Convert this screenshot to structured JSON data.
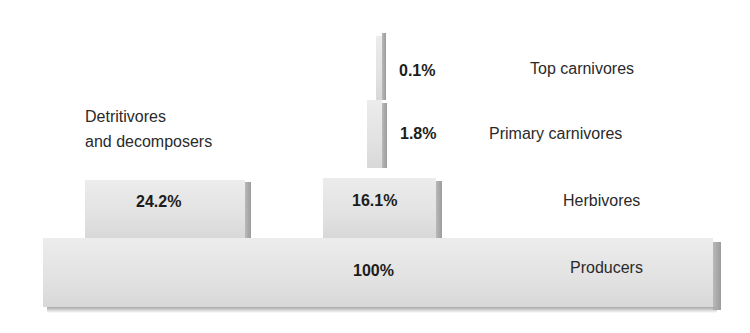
{
  "levels": [
    {
      "id": "top-carnivores",
      "name": "Top carnivores",
      "percent": "0.1%"
    },
    {
      "id": "primary-carnivores",
      "name": "Primary carnivores",
      "percent": "1.8%"
    },
    {
      "id": "herbivores",
      "name": "Herbivores",
      "percent": "16.1%"
    },
    {
      "id": "producers",
      "name": "Producers",
      "percent": "100%"
    }
  ],
  "side_branch": {
    "name_line1": "Detritivores",
    "name_line2": "and decomposers",
    "percent": "24.2%"
  },
  "colors": {
    "block_face": "#e4e4e4",
    "block_side": "#a8a8a8",
    "text": "#1e1e1e"
  }
}
